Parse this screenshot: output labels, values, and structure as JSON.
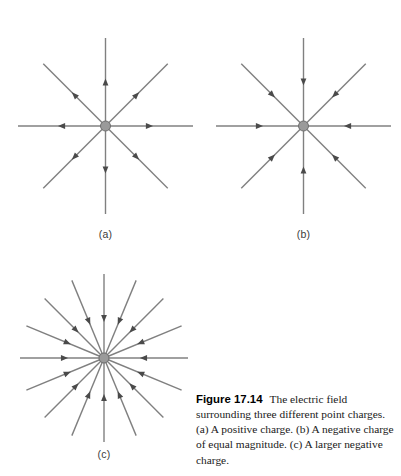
{
  "figure": {
    "number": "Figure 17.14",
    "caption_text": "The electric field surrounding three different point charges. (a) A positive charge. (b) A negative charge of equal magnitude. (c) A larger negative charge.",
    "panels": [
      {
        "id": "a",
        "label": "(a)",
        "charge_sign": "positive",
        "charge_description": "A positive charge",
        "line_count": 8,
        "angle_step_degrees": 45,
        "arrow_direction": "outward",
        "line_length": 88,
        "arrow_position_fraction": 0.5
      },
      {
        "id": "b",
        "label": "(b)",
        "charge_sign": "negative",
        "charge_description": "A negative charge of equal magnitude",
        "line_count": 8,
        "angle_step_degrees": 45,
        "arrow_direction": "inward",
        "line_length": 88,
        "arrow_position_fraction": 0.5
      },
      {
        "id": "c",
        "label": "(c)",
        "charge_sign": "negative",
        "charge_description": "A larger negative charge",
        "line_count": 16,
        "angle_step_degrees": 22.5,
        "arrow_direction": "inward",
        "line_length": 84,
        "arrow_position_fraction": 0.47
      }
    ],
    "style": {
      "line_color": "#808080",
      "arrow_color": "#4a4a4a",
      "charge_dot_fill": "#9a9a9a",
      "charge_dot_stroke": "#6e6e6e",
      "charge_dot_radius": 5,
      "line_width": 1.4,
      "background": "#ffffff",
      "label_color": "#3a3a3a",
      "caption_color": "#1a1a1a"
    }
  }
}
